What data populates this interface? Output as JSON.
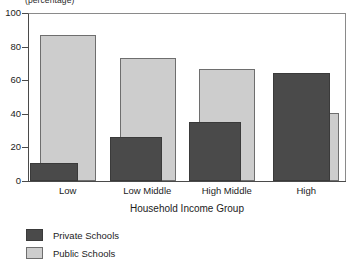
{
  "chart_data": {
    "type": "bar",
    "title": "",
    "unit_label": "(percentage)",
    "xlabel": "Household Income Group",
    "ylabel": "",
    "categories": [
      "Low",
      "Low Middle",
      "High Middle",
      "High"
    ],
    "series": [
      {
        "name": "Private Schools",
        "color": "#4a4a4a",
        "values": [
          11,
          26,
          35,
          64.5
        ]
      },
      {
        "name": "Public Schools",
        "color": "#cdcdcd",
        "values": [
          87,
          73.5,
          66.5,
          40.5
        ]
      }
    ],
    "ylim": [
      0,
      100
    ],
    "yticks": [
      0,
      20,
      40,
      60,
      80,
      100
    ],
    "ytick_labels": [
      "0",
      "20",
      "40",
      "60",
      "80",
      "100"
    ],
    "grid": false,
    "legend_position": "bottom-left",
    "bar_style": "overlapping"
  },
  "legend": {
    "items": [
      {
        "label": "Private Schools",
        "swatch": "private"
      },
      {
        "label": "Public Schools",
        "swatch": "public"
      }
    ]
  }
}
